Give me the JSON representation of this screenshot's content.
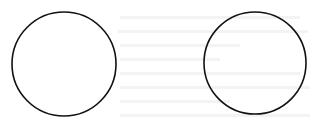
{
  "diagram": {
    "width": 316,
    "height": 130,
    "background": "#ffffff",
    "stroke_color": "#111111",
    "stroke_width": 1.6,
    "fill": "#ffffff",
    "shapes": [
      {
        "type": "circle",
        "name": "left-circle",
        "cx": 64,
        "cy": 64,
        "r": 52
      },
      {
        "type": "circle",
        "name": "right-circle",
        "cx": 255,
        "cy": 63,
        "r": 51
      }
    ]
  }
}
